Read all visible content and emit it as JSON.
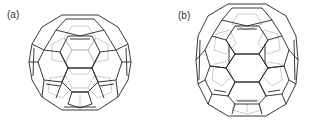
{
  "figure": {
    "panels": [
      {
        "label": "(a)",
        "description": "C60 fullerene, truncated icosahedron, near-spherical"
      },
      {
        "label": "(b)",
        "description": "C70 fullerene, elongated (ellipsoidal) cage"
      }
    ],
    "colors": {
      "front_edges": "#222222",
      "back_edges": "#b5b5b5",
      "background": "#ffffff"
    }
  }
}
